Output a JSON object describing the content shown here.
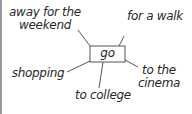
{
  "diagram": {
    "type": "word-web",
    "center": "go",
    "branches": [
      {
        "id": "top-left",
        "line1": "away for the",
        "line2": "weekend"
      },
      {
        "id": "top-right",
        "line1": "for a walk"
      },
      {
        "id": "left",
        "line1": "shopping"
      },
      {
        "id": "bottom",
        "line1": "to college"
      },
      {
        "id": "bottom-right",
        "line1": "to the",
        "line2": "cinema"
      }
    ],
    "colors": {
      "ink": "#2a2a2a",
      "line": "#555555",
      "edge": "#9a9a9a"
    }
  }
}
